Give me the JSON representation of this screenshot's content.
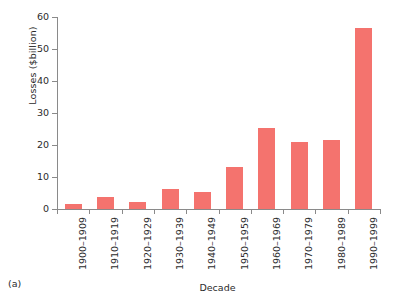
{
  "chart_data": {
    "type": "bar",
    "title": "",
    "xlabel": "Decade",
    "ylabel": "Losses ($billion)",
    "categories": [
      "1900–1909",
      "1910–1919",
      "1920–1929",
      "1930–1939",
      "1940–1949",
      "1950–1959",
      "1960–1969",
      "1970–1979",
      "1980–1989",
      "1990–1999"
    ],
    "values": [
      1.5,
      3.7,
      2.3,
      6.2,
      5.4,
      13.0,
      25.3,
      20.8,
      21.5,
      56.5
    ],
    "ylim": [
      0,
      60
    ],
    "yticks": [
      0,
      10,
      20,
      30,
      40,
      50,
      60
    ],
    "ytick_labels": [
      "0",
      "10",
      "20",
      "30",
      "40",
      "50",
      "60"
    ],
    "grid": false,
    "legend": null,
    "bar_color": "#f4736e",
    "axis_color": "#8a8a8a"
  },
  "figure": {
    "panel_caption": "(a)"
  }
}
